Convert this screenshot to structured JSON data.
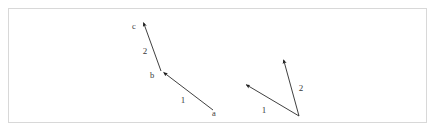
{
  "figure": {
    "background_color": "#ffffff",
    "frame_border_color": "#d8d8d8",
    "line_color": "#2a2a2a",
    "label_color": "#3a3a3a",
    "left_group": {
      "name": "head-to-tail-vector-chain",
      "vector_1": {
        "label": "1",
        "label_x": 183,
        "label_y": 103,
        "tail_x": 213,
        "tail_y": 110,
        "tip_x": 163,
        "tip_y": 72
      },
      "vector_2": {
        "label": "2",
        "label_x": 145,
        "label_y": 54,
        "tail_x": 161,
        "tail_y": 71,
        "tip_x": 143,
        "tip_y": 21
      },
      "point_a": {
        "label": "a",
        "x": 214,
        "y": 116
      },
      "point_b": {
        "label": "b",
        "x": 152,
        "y": 78
      },
      "point_c": {
        "label": "c",
        "x": 134,
        "y": 29
      }
    },
    "right_group": {
      "name": "common-origin-vector-pair",
      "origin_x": 299,
      "origin_y": 116,
      "vector_1": {
        "label": "1",
        "label_x": 264,
        "label_y": 113,
        "tail_x": 299,
        "tail_y": 116,
        "tip_x": 245,
        "tip_y": 84
      },
      "vector_2": {
        "label": "2",
        "label_x": 301,
        "label_y": 91,
        "tail_x": 299,
        "tail_y": 116,
        "tip_x": 283,
        "tip_y": 58
      }
    }
  }
}
